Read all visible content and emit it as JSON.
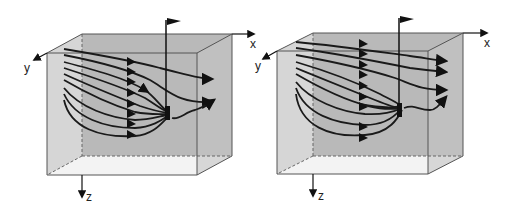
{
  "figure": {
    "panels": [
      {
        "id": "left",
        "description": "3D box with streamlines converging into a sink (well) and partially exiting",
        "axes": {
          "x": "x",
          "y": "y",
          "z": "z"
        }
      },
      {
        "id": "right",
        "description": "3D box with streamlines converging into a sink (well), mostly passing through",
        "axes": {
          "x": "x",
          "y": "y",
          "z": "z"
        }
      }
    ],
    "colors": {
      "back_face": "#b9b9b9",
      "side_face": "#d4d4d4",
      "bottom_face": "#f2f2f2",
      "edge": "#555555",
      "streamline": "#1a1a1a"
    }
  }
}
